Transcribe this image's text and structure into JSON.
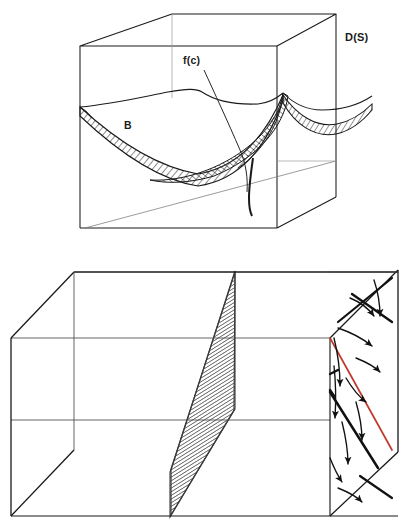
{
  "figure": {
    "background_color": "#ffffff",
    "ink_color": "#1a1a1a",
    "accent_color": "#c0392b",
    "hatch_color": "#2b2b2b"
  },
  "panels": [
    {
      "id": "top-panel",
      "name": "cube-with-branched-surface",
      "labels": {
        "ds": "D(S)",
        "fc": "f(c)",
        "b": "B"
      },
      "elements": {
        "cube_name": "wireframe-cube",
        "surface_name": "branched-saddle-surface",
        "band_name": "hatched-band",
        "leader_name": "fc-leader-line"
      }
    },
    {
      "id": "bottom-panel",
      "name": "flow-box-with-vector-field",
      "elements": {
        "box_name": "wireframe-box",
        "left_face_name": "left-flow-face",
        "right_face_name": "right-flow-face",
        "center_panel_name": "center-hatched-section",
        "red_line_name": "red-separatrix-line",
        "arrow_name": "flow-arrow"
      },
      "counts": {
        "left_red_lines": 2,
        "right_red_lines": 1
      }
    }
  ]
}
